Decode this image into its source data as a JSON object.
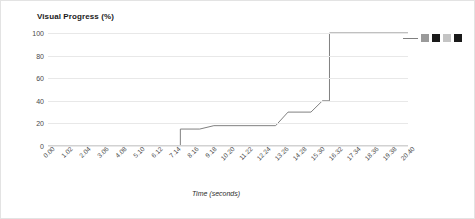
{
  "chart_data": {
    "type": "line",
    "title": "Visual Progress (%)",
    "xlabel": "Time (seconds)",
    "ylabel": "",
    "xlim": [
      0,
      20.4
    ],
    "ylim": [
      0,
      100
    ],
    "grid": true,
    "legend_position": "top-right",
    "y_ticks": [
      0,
      20,
      40,
      60,
      80,
      100
    ],
    "y_tick_labels": [
      "0",
      "20",
      "40",
      "60",
      "80",
      "100"
    ],
    "x_tick_labels": [
      "0.00",
      "1.02",
      "2.04",
      "3.06",
      "4.08",
      "5.10",
      "6.12",
      "7.14",
      "8.16",
      "9.18",
      "10.20",
      "11.22",
      "12.24",
      "13.26",
      "14.28",
      "15.30",
      "16.32",
      "17.34",
      "18.36",
      "19.38",
      "20.40"
    ],
    "x_tick_values": [
      0.0,
      1.02,
      2.04,
      3.06,
      4.08,
      5.1,
      6.12,
      7.14,
      8.16,
      9.18,
      10.2,
      11.22,
      12.24,
      13.26,
      14.28,
      15.3,
      16.32,
      17.34,
      18.36,
      19.38,
      20.4
    ],
    "series": [
      {
        "name": "Visual Progress",
        "step": "post",
        "color": "#808080",
        "x": [
          0.0,
          7.5,
          7.5,
          8.6,
          9.4,
          12.9,
          13.6,
          14.9,
          15.55,
          15.95,
          15.95,
          20.4
        ],
        "y": [
          0,
          0,
          15,
          15,
          18,
          18,
          30,
          30,
          40,
          40,
          100,
          100
        ]
      }
    ],
    "annotations": []
  },
  "legend": {
    "items": [
      {
        "name": "legend-line-sample",
        "kind": "line",
        "color": "#808080"
      },
      {
        "name": "legend-swatch-1",
        "kind": "square",
        "color": "#9a9a9a"
      },
      {
        "name": "legend-swatch-2",
        "kind": "square",
        "color": "#1a1a1a"
      },
      {
        "name": "legend-swatch-3",
        "kind": "square",
        "color": "#c4c4c4"
      },
      {
        "name": "legend-swatch-4",
        "kind": "square",
        "color": "#1a1a1a"
      }
    ]
  }
}
